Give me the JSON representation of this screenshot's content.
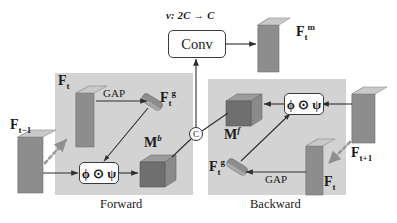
{
  "figure": {
    "type": "diagram",
    "panels": [
      {
        "id": "forward",
        "caption": "Forward"
      },
      {
        "id": "backward",
        "caption": "Backward"
      }
    ],
    "colors": {
      "panel_fill": "#d3d3d3",
      "slab_front": "#8d8d8d",
      "slab_side": "#bdbdbd",
      "cube_front": "#6f6f6f",
      "cube_top": "#8a8a8a",
      "cube_side": "#9a9a9a",
      "node_fill": "#fdfdfd",
      "stroke": "#333333",
      "dotted_arrow": "#9a9a9a",
      "background": "#ffffff"
    }
  },
  "labels": {
    "conv_block": "Conv",
    "conv_annotation_prefix": "v",
    "conv_annotation_colon": ": ",
    "conv_annotation_in": "2C",
    "conv_annotation_arrow": "→",
    "conv_annotation_out": "C",
    "conv_annotation_full": "v: 2C → C",
    "output_feature": {
      "base": "F",
      "sub": "t",
      "sup": "m",
      "full": "F_t^m"
    },
    "input_prev": {
      "base": "F",
      "sub": "t−1",
      "sup": "",
      "full": "F_{t-1}"
    },
    "input_next": {
      "base": "F",
      "sub": "t+1",
      "sup": "",
      "full": "F_{t+1}"
    },
    "feature_forward": {
      "base": "F",
      "sub": "t",
      "sup": "",
      "full": "F_t"
    },
    "feature_backward": {
      "base": "F",
      "sub": "t",
      "sup": "",
      "full": "F_t"
    },
    "global_forward": {
      "base": "F",
      "sub": "t",
      "sup": "g",
      "full": "F_t^g"
    },
    "global_backward": {
      "base": "F",
      "sub": "t",
      "sup": "g",
      "full": "F_t^g"
    },
    "gap_forward": "GAP",
    "gap_backward": "GAP",
    "mask_backward": {
      "base": "M",
      "sup": "b",
      "full": "M^b"
    },
    "mask_forward": {
      "base": "M",
      "sup": "f",
      "full": "M^f"
    },
    "op_forward": "ϕ ⊙ ψ",
    "op_backward": "ϕ ⊙ ψ",
    "concat": "C",
    "panel_forward": "Forward",
    "panel_backward": "Backward"
  },
  "icons": {
    "concat_circle": "concat-circle-icon",
    "warp_arrow_left": "dotted-warp-arrow-icon",
    "warp_arrow_right": "dotted-warp-arrow-icon",
    "feature_slab": "feature-map-slab-icon",
    "mask_cube": "mask-volume-cube-icon",
    "vector_slab": "pooled-vector-slab-icon"
  }
}
